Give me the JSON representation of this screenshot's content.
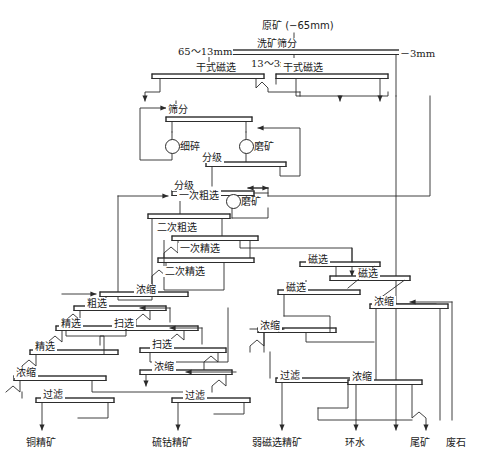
{
  "diagram": {
    "feed_label": "原矿 (−65mm)",
    "stroke": "#2b2b2b",
    "unit_fill": "#ffffff",
    "size_labels": [
      {
        "id": "size-65-13",
        "text": "65～13mm"
      },
      {
        "id": "size-13-3",
        "text": "13～3mm"
      },
      {
        "id": "size-minus-3",
        "text": "－3mm"
      }
    ],
    "units": [
      {
        "id": "u-washing-screening",
        "label": "洗矿筛分"
      },
      {
        "id": "u-dry-mag-1",
        "label": "干式磁选"
      },
      {
        "id": "u-dry-mag-2",
        "label": "干式磁选"
      },
      {
        "id": "u-screening",
        "label": "筛分"
      },
      {
        "id": "u-fine-crush",
        "label": "细碎"
      },
      {
        "id": "u-grinding-1",
        "label": "磨矿"
      },
      {
        "id": "u-classify-1",
        "label": "分级"
      },
      {
        "id": "u-classify-2",
        "label": "分级"
      },
      {
        "id": "u-rough-1",
        "label": "一次粗选"
      },
      {
        "id": "u-grinding-2",
        "label": "磨矿"
      },
      {
        "id": "u-rough-2",
        "label": "二次粗选"
      },
      {
        "id": "u-clean-1",
        "label": "一次精选"
      },
      {
        "id": "u-clean-2",
        "label": "二次精选"
      },
      {
        "id": "u-thicken-a",
        "label": "浓缩"
      },
      {
        "id": "u-rough-cu",
        "label": "粗选"
      },
      {
        "id": "u-clean-cu-1",
        "label": "精选"
      },
      {
        "id": "u-scav-1",
        "label": "扫选"
      },
      {
        "id": "u-clean-cu-2",
        "label": "精选"
      },
      {
        "id": "u-scav-2",
        "label": "扫选"
      },
      {
        "id": "u-thicken-cu",
        "label": "浓缩"
      },
      {
        "id": "u-filter-cu",
        "label": "过滤"
      },
      {
        "id": "u-thicken-s",
        "label": "浓缩"
      },
      {
        "id": "u-filter-s",
        "label": "过滤"
      },
      {
        "id": "u-mag-1",
        "label": "磁选"
      },
      {
        "id": "u-mag-2",
        "label": "磁选"
      },
      {
        "id": "u-mag-3",
        "label": "磁选"
      },
      {
        "id": "u-thicken-fe",
        "label": "浓缩"
      },
      {
        "id": "u-filter-fe",
        "label": "过滤"
      },
      {
        "id": "u-thicken-w",
        "label": "浓缩"
      },
      {
        "id": "u-thicken-t",
        "label": "浓缩"
      }
    ],
    "products": [
      {
        "id": "p-copper",
        "label": "铜精矿"
      },
      {
        "id": "p-sulfur-cobalt",
        "label": "硫钴精矿"
      },
      {
        "id": "p-weak-mag",
        "label": "弱磁选精矿"
      },
      {
        "id": "p-return-water",
        "label": "环水"
      },
      {
        "id": "p-tailings",
        "label": "尾矿"
      },
      {
        "id": "p-waste-rock",
        "label": "废石"
      }
    ]
  }
}
